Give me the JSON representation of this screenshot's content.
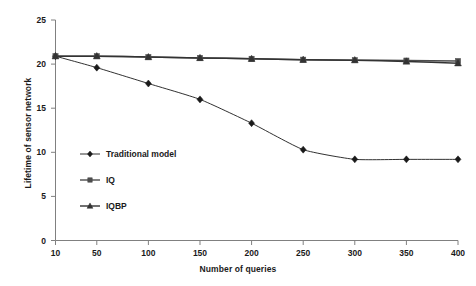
{
  "chart_data": {
    "type": "line",
    "title": "",
    "xlabel": "Number of queries",
    "ylabel": "Lifetime of sensor network",
    "x": [
      10,
      50,
      100,
      150,
      200,
      250,
      300,
      350,
      400
    ],
    "xtick_labels": [
      "10",
      "50",
      "100",
      "150",
      "200",
      "250",
      "300",
      "350",
      "400"
    ],
    "ytick_labels": [
      "0",
      "5",
      "10",
      "15",
      "20",
      "25"
    ],
    "yticks": [
      0,
      5,
      10,
      15,
      20,
      25
    ],
    "xlim": [
      10,
      400
    ],
    "ylim": [
      0,
      25
    ],
    "grid": false,
    "legend_position": "inside-left",
    "series": [
      {
        "name": "Traditional model",
        "marker": "diamond",
        "color": "#1a1a1a",
        "values": [
          20.9,
          19.6,
          17.8,
          16.0,
          13.3,
          10.3,
          9.2,
          9.2,
          9.2
        ]
      },
      {
        "name": "IQ",
        "marker": "square",
        "color": "#4d4d4d",
        "values": [
          20.9,
          20.9,
          20.8,
          20.7,
          20.6,
          20.5,
          20.45,
          20.4,
          20.35
        ]
      },
      {
        "name": "IQBP",
        "marker": "triangle",
        "color": "#333333",
        "values": [
          20.9,
          20.9,
          20.8,
          20.7,
          20.6,
          20.5,
          20.45,
          20.3,
          20.1
        ]
      }
    ]
  },
  "legend": {
    "entries": [
      {
        "label": "Traditional model",
        "marker": "diamond"
      },
      {
        "label": "IQ",
        "marker": "square"
      },
      {
        "label": "IQBP",
        "marker": "triangle"
      }
    ]
  }
}
